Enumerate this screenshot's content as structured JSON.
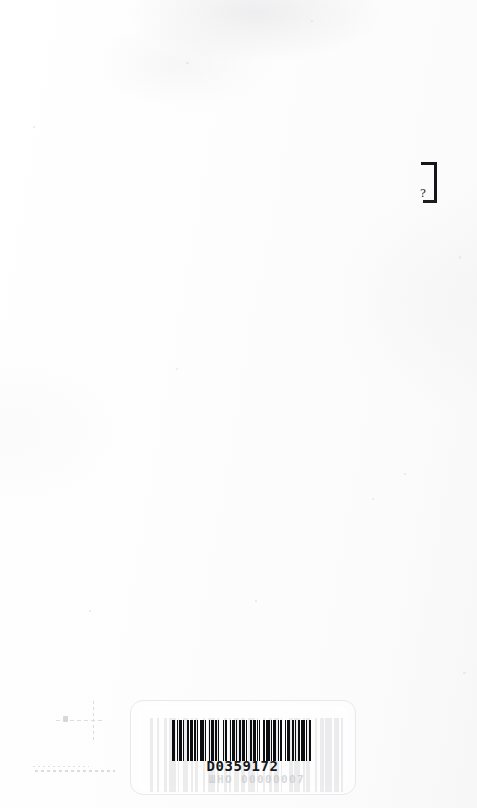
{
  "page": {
    "kind": "scanned-book-page",
    "width": 477,
    "height": 808,
    "background_color": "#fefefe",
    "paper_tone_color": "#fbfbfc",
    "content_summary": "Nearly blank scanned page with a cut-off bracket glyph at the upper right edge, faint stamp smudges at lower left, and a library barcode label at the bottom center."
  },
  "edge_glyph": {
    "name": "closing-square-bracket",
    "character": "]",
    "secondary_mark": "?",
    "ink_color": "#14161a"
  },
  "faint_marks": {
    "cross_mark_label": "faint cross-hatch stamp (illegible)",
    "smudge_line_label": "faint horizontal smudge line (illegible)",
    "ink_color": "#8f9197"
  },
  "barcode_label": {
    "border_color": "#e9e9ec",
    "bar_color": "#0c0d10",
    "text_color": "#16181c",
    "code": "D0359172",
    "ghost_text": "ШНО 00000007",
    "bar_pattern": [
      3,
      2,
      1,
      2,
      3,
      1,
      1,
      3,
      2,
      1,
      4,
      1,
      2,
      1,
      1,
      2,
      4,
      2,
      1,
      3,
      1,
      1,
      3,
      1,
      2,
      2,
      1,
      4,
      1,
      1,
      2,
      3,
      1,
      2,
      3,
      1,
      1,
      2,
      2,
      1,
      4,
      1,
      1,
      3,
      2,
      1,
      3,
      1,
      1,
      2,
      1,
      3,
      2,
      1,
      4,
      1,
      2,
      1,
      3,
      2,
      1,
      1,
      2,
      4,
      1,
      1,
      3,
      2,
      2,
      1,
      1,
      3,
      2,
      1,
      4,
      1,
      1,
      2,
      3,
      1
    ],
    "ghost_bar_pattern": [
      2,
      2,
      1,
      3,
      2,
      1,
      4,
      1,
      1,
      2,
      3,
      2,
      1,
      1,
      2,
      3,
      1,
      2,
      4,
      1,
      1,
      3,
      2,
      1,
      1,
      2,
      3,
      1,
      2,
      2,
      4,
      1,
      1,
      3,
      1,
      2,
      2,
      1,
      3,
      1,
      1,
      4,
      2,
      1,
      3,
      2,
      1,
      1,
      2,
      3,
      1,
      2,
      2,
      1,
      4,
      1,
      3,
      1,
      1,
      2
    ]
  }
}
